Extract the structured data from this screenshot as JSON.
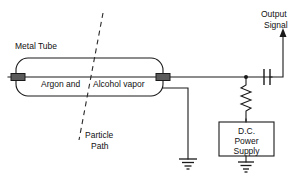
{
  "diagram": {
    "labels": {
      "metal_tube": "Metal Tube",
      "gas_fill": "Argon and   Alcohol vapor",
      "gas_fill_part1": "Argon and",
      "gas_fill_part2": "Alcohol vapor",
      "particle_path_line1": "Particle",
      "particle_path_line2": "Path",
      "output_line1": "Output",
      "output_line2": "Signal",
      "psu_line1": "D.C.",
      "psu_line2": "Power",
      "psu_line3": "Supply"
    },
    "components": {
      "tube": "geiger-muller-tube",
      "capacitor": "coupling-capacitor",
      "resistor": "load-resistor",
      "power_supply": "dc-power-supply",
      "ground_tube": "tube-ground",
      "ground_psu": "power-supply-ground",
      "output_arrow": "output-signal-arrow",
      "particle": "ionizing-particle-track"
    },
    "colors": {
      "line": "#1a1a1a",
      "background": "#ffffff",
      "endcap": "#5a5a5a",
      "text": "#111111"
    }
  }
}
